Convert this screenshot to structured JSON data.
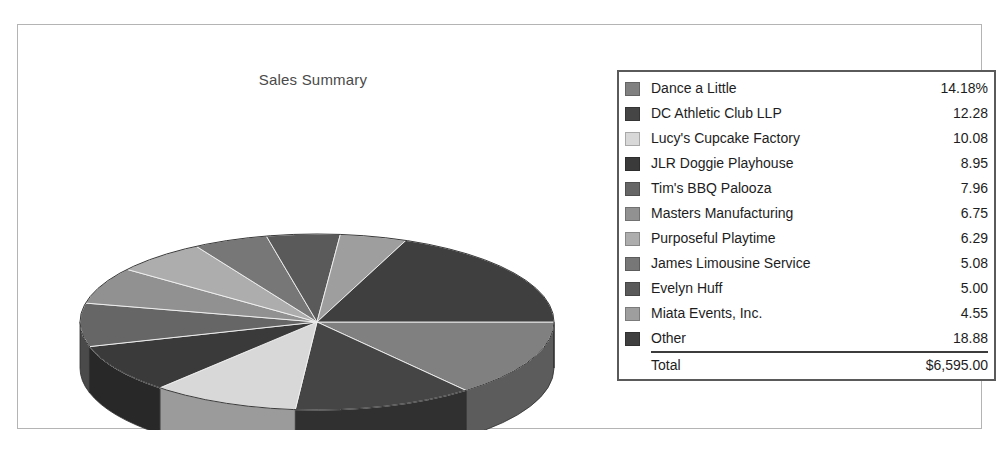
{
  "report": {
    "frame_border_color": "#b4b4b4",
    "background_color": "#ffffff"
  },
  "chart": {
    "title": "Sales Summary"
  },
  "legend": {
    "border_color": "#5a5a5a",
    "total_label": "Total",
    "total_value": "$6,595.00"
  },
  "chart_data": {
    "type": "pie",
    "title": "Sales Summary",
    "xlabel": "",
    "ylabel": "",
    "value_unit": "percent",
    "first_value_suffix": "%",
    "total_label": "Total",
    "total_value": "$6,595.00",
    "legend_position": "right",
    "grid": false,
    "three_d": true,
    "start_angle_deg": 0,
    "direction": "clockwise",
    "labels": [
      "Dance a Little",
      "DC Athletic Club LLP",
      "Lucy's Cupcake Factory",
      "JLR Doggie Playhouse",
      "Tim's BBQ Palooza",
      "Masters Manufacturing",
      "Purposeful Playtime",
      "James Limousine Service",
      "Evelyn Huff",
      "Miata Events, Inc.",
      "Other"
    ],
    "values": [
      14.18,
      12.28,
      10.08,
      8.95,
      7.96,
      6.75,
      6.29,
      5.08,
      5.0,
      4.55,
      18.88
    ],
    "display_values": [
      "14.18%",
      "12.28",
      "10.08",
      "8.95",
      "7.96",
      "6.75",
      "6.29",
      "5.08",
      "5.00",
      "4.55",
      "18.88"
    ],
    "colors": [
      "#808080",
      "#454545",
      "#d8d8d8",
      "#3a3a3a",
      "#666666",
      "#919191",
      "#adadad",
      "#777777",
      "#5a5a5a",
      "#9e9e9e",
      "#3f3f3f"
    ],
    "side_colors": [
      "#5c5c5c",
      "#303030",
      "#9b9b9b",
      "#282828",
      "#4a4a4a",
      "#696969",
      "#7d7d7d",
      "#565656",
      "#414141",
      "#737373",
      "#2c2c2c"
    ]
  }
}
